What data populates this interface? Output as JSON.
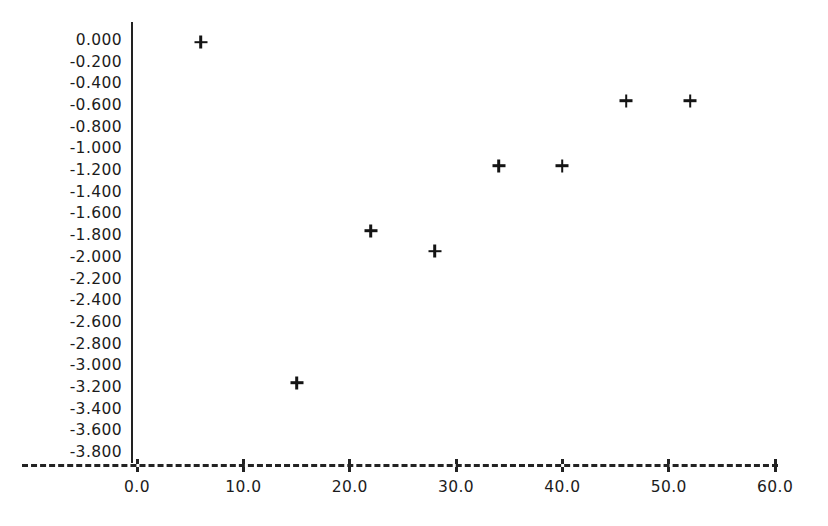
{
  "chart_data": {
    "type": "scatter",
    "title": "",
    "subtitle": "",
    "xlabel": "",
    "ylabel": "",
    "xlim": [
      0.0,
      60.0
    ],
    "ylim": [
      -3.8,
      0.0
    ],
    "grid": false,
    "legend": null,
    "marker": "plus",
    "marker_color": "#141414",
    "axis_color": "#222222",
    "x_axis_style": "dashed",
    "y_axis_style": "solid",
    "x_tick_labels": [
      "0.0",
      "10.0",
      "20.0",
      "30.0",
      "40.0",
      "50.0",
      "60.0"
    ],
    "x_ticks": [
      0.0,
      10.0,
      20.0,
      30.0,
      40.0,
      50.0,
      60.0
    ],
    "y_tick_labels": [
      "0.000",
      "-0.200",
      "-0.400",
      "-0.600",
      "-0.800",
      "-1.000",
      "-1.200",
      "-1.400",
      "-1.600",
      "-1.800",
      "-2.000",
      "-2.200",
      "-2.400",
      "-2.600",
      "-2.800",
      "-3.000",
      "-3.200",
      "-3.400",
      "-3.600",
      "-3.800"
    ],
    "y_ticks": [
      0.0,
      -0.2,
      -0.4,
      -0.6,
      -0.8,
      -1.0,
      -1.2,
      -1.4,
      -1.6,
      -1.8,
      -2.0,
      -2.2,
      -2.4,
      -2.6,
      -2.8,
      -3.0,
      -3.2,
      -3.4,
      -3.6,
      -3.8
    ],
    "x": [
      6.0,
      15.0,
      22.0,
      28.0,
      34.0,
      40.0,
      46.0,
      52.0
    ],
    "y": [
      -0.01,
      -3.15,
      -1.75,
      -1.94,
      -1.15,
      -1.15,
      -0.55,
      -0.55
    ],
    "points": [
      {
        "x": 6.0,
        "y": -0.01
      },
      {
        "x": 15.0,
        "y": -3.15
      },
      {
        "x": 22.0,
        "y": -1.75
      },
      {
        "x": 28.0,
        "y": -1.94
      },
      {
        "x": 34.0,
        "y": -1.15
      },
      {
        "x": 40.0,
        "y": -1.15
      },
      {
        "x": 46.0,
        "y": -0.55
      },
      {
        "x": 52.0,
        "y": -0.55
      }
    ]
  }
}
